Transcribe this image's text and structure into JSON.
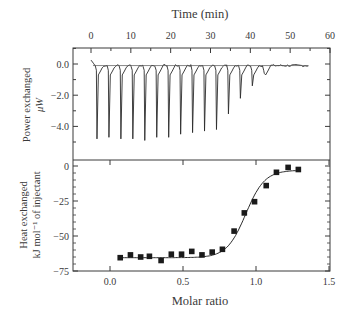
{
  "chart_data": [
    {
      "type": "line",
      "title": "",
      "xlabel": "Time (min)",
      "ylabel": [
        "Power exchanged",
        "μW"
      ],
      "xlim": [
        -4.5,
        60
      ],
      "ylim": [
        -6.1,
        1.0
      ],
      "x_ticks": [
        0,
        10,
        20,
        30,
        40,
        50,
        60
      ],
      "x_tick_labels": [
        "0",
        "10",
        "20",
        "30",
        "40",
        "50",
        "60"
      ],
      "y_ticks": [
        0.0,
        -2.0,
        -4.0
      ],
      "y_tick_labels": [
        "0.0",
        "−2.0",
        "−4.0"
      ],
      "x_axis_position": "top",
      "grid": false,
      "baseline": -0.1,
      "series": [
        {
          "name": "Injection peaks",
          "peak_times_min": [
            1.5,
            4.5,
            7.5,
            10.5,
            13.5,
            16.5,
            19.5,
            22.5,
            25.5,
            28.5,
            31.5,
            34.5,
            37.5,
            40.5,
            43.5
          ],
          "peak_values_uW": [
            -4.8,
            -4.7,
            -4.8,
            -4.8,
            -4.9,
            -4.7,
            -4.7,
            -4.5,
            -4.4,
            -4.3,
            -4.2,
            -3.2,
            -2.2,
            -1.4,
            -0.6
          ]
        }
      ]
    },
    {
      "type": "scatter",
      "title": "",
      "xlabel": "Molar ratio",
      "ylabel": [
        "Heat exchanged",
        "kJ mol⁻¹ of injectant"
      ],
      "xlim": [
        -0.25,
        1.5
      ],
      "ylim": [
        -75,
        3
      ],
      "x_ticks": [
        0.0,
        0.5,
        1.0,
        1.5
      ],
      "x_tick_labels": [
        "0.0",
        "0.5",
        "1.0",
        "1.5"
      ],
      "y_ticks": [
        0,
        -25,
        -50,
        -75
      ],
      "y_tick_labels": [
        "0",
        "−25",
        "−50",
        "−75"
      ],
      "grid": false,
      "series": [
        {
          "name": "Integrated heats",
          "marker": "square",
          "x": [
            0.07,
            0.14,
            0.21,
            0.27,
            0.35,
            0.42,
            0.49,
            0.56,
            0.63,
            0.7,
            0.77,
            0.85,
            0.92,
            0.99,
            1.07,
            1.14,
            1.22,
            1.29
          ],
          "y": [
            -65.5,
            -63.5,
            -65.0,
            -64.5,
            -67.5,
            -63.0,
            -63.0,
            -61.0,
            -63.5,
            -61.5,
            -59.5,
            -46.5,
            -33.5,
            -25.5,
            -14.0,
            -4.5,
            -1.0,
            -2.5
          ]
        },
        {
          "name": "Fit",
          "type": "line",
          "model": "sigmoid",
          "low": -65.5,
          "high": -3.0,
          "midpoint": 0.93,
          "width": 0.065,
          "x_range": [
            0.07,
            1.3
          ]
        }
      ]
    }
  ]
}
